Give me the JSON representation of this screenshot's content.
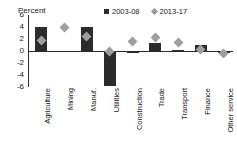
{
  "chart_data": {
    "type": "bar",
    "title": "",
    "subtitle": "",
    "xlabel": "",
    "ylabel": "Percent",
    "ylim": [
      -6,
      6
    ],
    "yticks": [
      6,
      4,
      2,
      0,
      -2,
      -4,
      -6
    ],
    "ytick_labels": [
      "6",
      "4",
      "2",
      "0",
      "-2",
      "-4",
      "-6"
    ],
    "grid": false,
    "legend_position": "top-right",
    "categories": [
      "Agriculture",
      "Mining",
      "Manuf.",
      "Utilities",
      "Construction",
      "Trade",
      "Transport",
      "Finance",
      "Other service"
    ],
    "series": [
      {
        "name": "2003-08",
        "marker": "bar",
        "color": "#2b2b2b",
        "values": [
          4.0,
          0.0,
          4.0,
          -5.8,
          -0.2,
          1.4,
          0.2,
          1.0,
          -0.1
        ]
      },
      {
        "name": "2013-17",
        "marker": "diamond",
        "color": "#9e9e9e",
        "values": [
          1.8,
          3.9,
          2.5,
          0.0,
          1.6,
          2.2,
          1.4,
          0.3,
          -0.4
        ]
      }
    ]
  },
  "axis": {
    "unit_label": "Percent"
  },
  "legend": {
    "entries": [
      {
        "label": "2003-08",
        "swatch": "square-dark-icon"
      },
      {
        "label": "2013-17",
        "swatch": "diamond-gray-icon"
      }
    ]
  }
}
